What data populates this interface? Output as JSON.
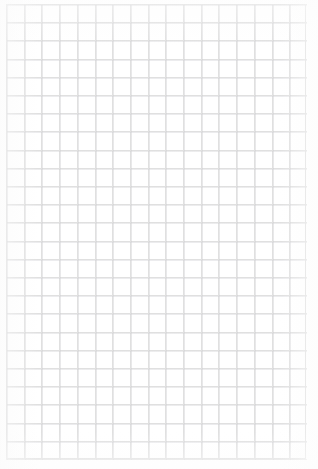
{
  "document": {
    "kind": "grid-paper-sheet",
    "title": "",
    "visible_text": "",
    "background_color": "#ffffff",
    "page_width_px": 318,
    "page_height_px": 469
  },
  "grid": {
    "line_color": "#e0e0e0",
    "secondary_line_color": "#cdcdd0",
    "border_color": "#dddddd",
    "cell_width_px": 17.7,
    "cell_height_px": 18.2,
    "columns": 17,
    "rows": 25,
    "offset_left_px": 6,
    "offset_top_px": 4,
    "block_width_px": 301,
    "block_height_px": 456
  },
  "margins": {
    "top_px": 4,
    "bottom_px": 9,
    "left_px": 6,
    "right_px": 11,
    "color": "#ffffff"
  },
  "content": {
    "has_text": false,
    "has_images": false,
    "has_annotations": false,
    "note": ""
  }
}
